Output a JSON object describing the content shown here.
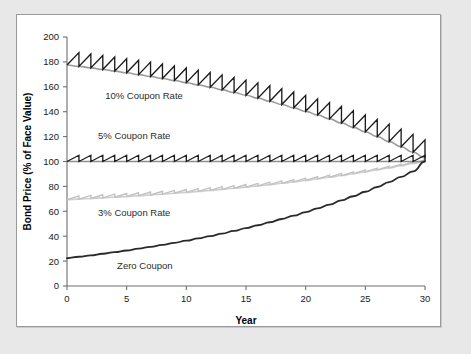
{
  "chart_data": {
    "type": "line",
    "title": "",
    "xlabel": "Year",
    "ylabel": "Bond Price (% of Face Value)",
    "xlim": [
      0,
      30
    ],
    "ylim": [
      0,
      200
    ],
    "xticks": [
      0,
      5,
      10,
      15,
      20,
      25,
      30
    ],
    "yticks": [
      0,
      20,
      40,
      60,
      80,
      100,
      120,
      140,
      160,
      180,
      200
    ],
    "grid": false,
    "legend_position": "inline-annotations",
    "series": [
      {
        "name": "10% Coupon Rate",
        "label": "10% Coupon Rate",
        "color": "#1c1c1c",
        "envelope_color": "#9b9b9b",
        "style": "sawtooth",
        "x": [
          0,
          1,
          2,
          3,
          4,
          5,
          6,
          7,
          8,
          9,
          10,
          11,
          12,
          13,
          14,
          15,
          16,
          17,
          18,
          19,
          20,
          21,
          22,
          23,
          24,
          25,
          26,
          27,
          28,
          29,
          30
        ],
        "values": [
          177.5,
          176.4,
          175.2,
          173.9,
          172.6,
          171.3,
          169.8,
          168.3,
          166.7,
          165.1,
          163.3,
          161.5,
          159.6,
          157.5,
          155.4,
          153.2,
          150.9,
          148.4,
          145.8,
          143.1,
          140.3,
          137.3,
          134.2,
          130.9,
          127.4,
          123.8,
          120.0,
          116.0,
          111.8,
          107.4,
          102.8
        ],
        "peak_values": [
          187.5,
          186.4,
          185.2,
          183.9,
          182.6,
          181.3,
          179.8,
          178.3,
          176.7,
          175.1,
          173.3,
          171.5,
          169.6,
          167.5,
          165.4,
          163.2,
          160.9,
          158.4,
          155.8,
          153.1,
          150.3,
          147.3,
          144.2,
          140.9,
          137.4,
          133.8,
          130.0,
          126.0,
          121.8,
          117.4,
          102.8
        ],
        "value_at_start": 177.5,
        "value_at_maturity": 100
      },
      {
        "name": "5% Coupon Rate",
        "label": "5% Coupon Rate",
        "color": "#1c1c1c",
        "envelope_color": "#8f8f8f",
        "style": "sawtooth",
        "x": [
          0,
          1,
          2,
          3,
          4,
          5,
          6,
          7,
          8,
          9,
          10,
          11,
          12,
          13,
          14,
          15,
          16,
          17,
          18,
          19,
          20,
          21,
          22,
          23,
          24,
          25,
          26,
          27,
          28,
          29,
          30
        ],
        "values": [
          100,
          100,
          100,
          100,
          100,
          100,
          100,
          100,
          100,
          100,
          100,
          100,
          100,
          100,
          100,
          100,
          100,
          100,
          100,
          100,
          100,
          100,
          100,
          100,
          100,
          100,
          100,
          100,
          100,
          100,
          100
        ],
        "peak_values": [
          105,
          105,
          105,
          105,
          105,
          105,
          105,
          105,
          105,
          105,
          105,
          105,
          105,
          105,
          105,
          105,
          105,
          105,
          105,
          105,
          105,
          105,
          105,
          105,
          105,
          105,
          105,
          105,
          105,
          105,
          100
        ],
        "value_at_start": 100,
        "value_at_maturity": 100
      },
      {
        "name": "3% Coupon Rate",
        "label": "3% Coupon Rate",
        "color": "#c2c2c2",
        "envelope_color": "#cfcfcf",
        "style": "sawtooth",
        "x": [
          0,
          1,
          2,
          3,
          4,
          5,
          6,
          7,
          8,
          9,
          10,
          11,
          12,
          13,
          14,
          15,
          16,
          17,
          18,
          19,
          20,
          21,
          22,
          23,
          24,
          25,
          26,
          27,
          28,
          29,
          30
        ],
        "values": [
          69.3,
          69.8,
          70.3,
          70.8,
          71.3,
          71.9,
          72.5,
          73.1,
          73.8,
          74.5,
          75.2,
          76.0,
          76.8,
          77.6,
          78.5,
          79.4,
          80.4,
          81.4,
          82.5,
          83.6,
          84.8,
          86.1,
          87.4,
          88.7,
          90.2,
          91.7,
          93.3,
          94.9,
          96.7,
          98.5,
          100.4
        ],
        "peak_values": [
          72.3,
          72.8,
          73.3,
          73.8,
          74.3,
          74.9,
          75.5,
          76.1,
          76.8,
          77.5,
          78.2,
          79.0,
          79.8,
          80.6,
          81.5,
          82.4,
          83.4,
          84.4,
          85.5,
          86.6,
          87.8,
          89.1,
          90.4,
          91.7,
          93.2,
          94.7,
          96.3,
          97.9,
          99.7,
          101.5,
          100.4
        ],
        "value_at_start": 69.3,
        "value_at_maturity": 100
      },
      {
        "name": "Zero Coupon",
        "label": "Zero Coupon",
        "color": "#2a2a2a",
        "style": "smooth",
        "x": [
          0,
          1,
          2,
          3,
          4,
          5,
          6,
          7,
          8,
          9,
          10,
          11,
          12,
          13,
          14,
          15,
          16,
          17,
          18,
          19,
          20,
          21,
          22,
          23,
          24,
          25,
          26,
          27,
          28,
          29,
          30
        ],
        "values": [
          22.3,
          23.5,
          24.6,
          25.9,
          27.2,
          28.5,
          30.0,
          31.5,
          33.0,
          34.7,
          36.4,
          38.2,
          40.1,
          42.1,
          44.2,
          46.5,
          48.8,
          51.2,
          53.8,
          56.5,
          59.3,
          62.3,
          65.4,
          68.7,
          72.1,
          75.7,
          79.5,
          83.5,
          87.7,
          92.1,
          100.0
        ],
        "value_at_start": 22.3,
        "value_at_maturity": 100
      }
    ],
    "annotations": [
      {
        "text": "10% Coupon Rate",
        "x": 3.2,
        "y": 150
      },
      {
        "text": "5% Coupon Rate",
        "x": 2.6,
        "y": 118
      },
      {
        "text": "3% Coupon Rate",
        "x": 2.6,
        "y": 56
      },
      {
        "text": "Zero Coupon",
        "x": 4.2,
        "y": 14
      }
    ]
  },
  "colors": {
    "page_background": "#e8e8e8",
    "panel_background": "#ffffff",
    "panel_border": "#9a9a9a",
    "axis": "#6e6e6e",
    "text": "#1a1a1a"
  }
}
